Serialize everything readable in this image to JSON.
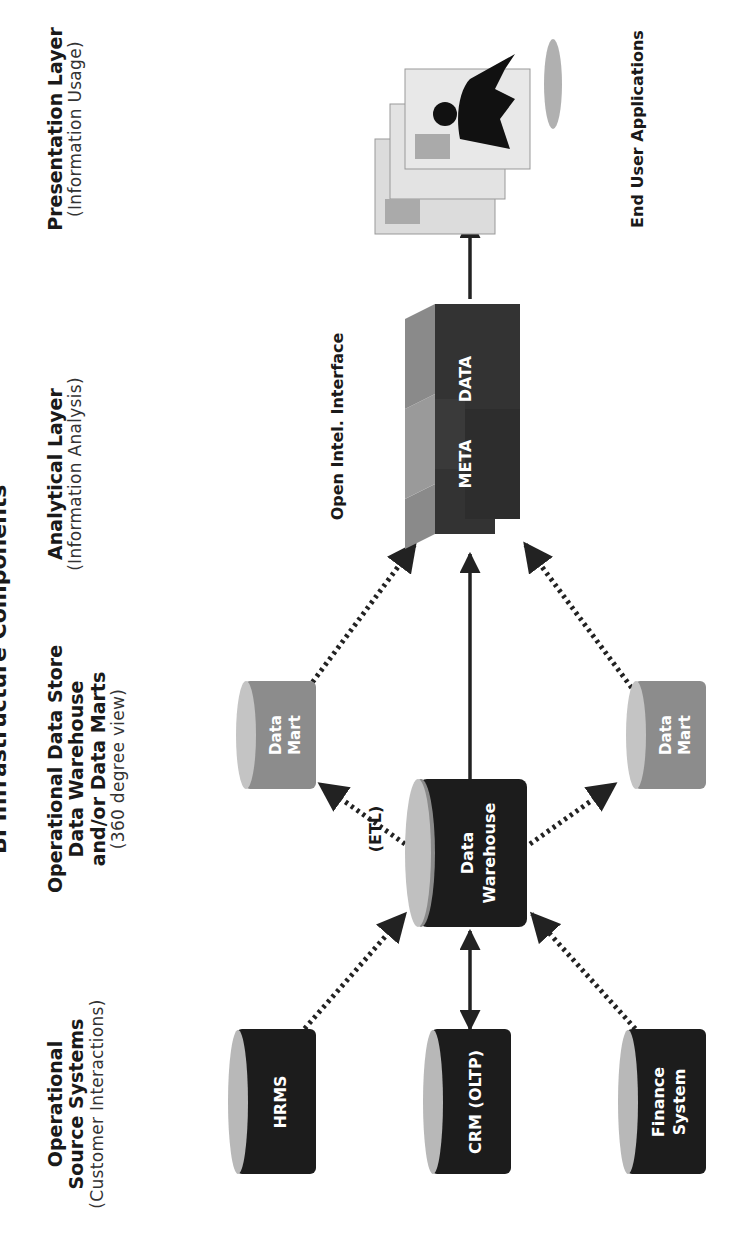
{
  "title": "BI Infrastructure Components",
  "columns": [
    {
      "heading": "Operational Source Systems",
      "heading_lines": [
        "Operational",
        "Source Systems"
      ],
      "sub": "(Customer Interactions)"
    },
    {
      "heading": "Operational Data Store Data Warehouse and/or Data Marts",
      "heading_lines": [
        "Operational Data Store",
        "Data Warehouse",
        "and/or Data Marts"
      ],
      "sub": "(360 degree view)"
    },
    {
      "heading": "Analytical Layer",
      "heading_lines": [
        "Analytical Layer"
      ],
      "sub": "(Information Analysis)"
    },
    {
      "heading": "Presentation Layer",
      "heading_lines": [
        "Presentation Layer"
      ],
      "sub": "(Information Usage)"
    }
  ],
  "sources": [
    {
      "label": "HRMS",
      "lines": [
        "HRMS"
      ]
    },
    {
      "label": "CRM (OLTP)",
      "lines": [
        "CRM (OLTP)"
      ]
    },
    {
      "label": "Finance System",
      "lines": [
        "Finance",
        "System"
      ]
    }
  ],
  "warehouse": {
    "label": "Data Warehouse",
    "lines": [
      "Data",
      "Warehouse"
    ],
    "process_label": "(ETL)"
  },
  "data_marts": [
    {
      "label": "Data Mart",
      "lines": [
        "Data",
        "Mart"
      ]
    },
    {
      "label": "Data Mart",
      "lines": [
        "Data",
        "Mart"
      ]
    }
  ],
  "analytical": {
    "block_labels": [
      "META",
      "DATA"
    ],
    "interface_label": "Open Intel. Interface"
  },
  "presentation": {
    "label": "End User Applications",
    "icon": "user-with-screens-icon"
  },
  "colors": {
    "dark_cylinder": "#1c1c1c",
    "cylinder_cap": "#b8b8b8",
    "mart_body": "#8c8c8c",
    "cube_dark": "#333333",
    "cube_light": "#8a8a8a",
    "arrow": "#222222"
  },
  "connections": [
    {
      "from": "HRMS",
      "to": "Data Warehouse",
      "style": "dotted",
      "direction": "forward"
    },
    {
      "from": "CRM (OLTP)",
      "to": "Data Warehouse",
      "style": "solid",
      "direction": "both"
    },
    {
      "from": "Finance System",
      "to": "Data Warehouse",
      "style": "dotted",
      "direction": "forward"
    },
    {
      "from": "Data Warehouse",
      "to": "Data Mart (top)",
      "style": "dotted",
      "direction": "forward"
    },
    {
      "from": "Data Warehouse",
      "to": "Data Mart (bottom)",
      "style": "dotted",
      "direction": "forward"
    },
    {
      "from": "Data Warehouse",
      "to": "META DATA",
      "style": "solid",
      "direction": "forward"
    },
    {
      "from": "Data Mart (top)",
      "to": "META DATA",
      "style": "dotted",
      "direction": "forward"
    },
    {
      "from": "Data Mart (bottom)",
      "to": "META DATA",
      "style": "dotted",
      "direction": "forward"
    },
    {
      "from": "META DATA",
      "to": "End User Applications",
      "style": "solid",
      "direction": "forward"
    }
  ]
}
